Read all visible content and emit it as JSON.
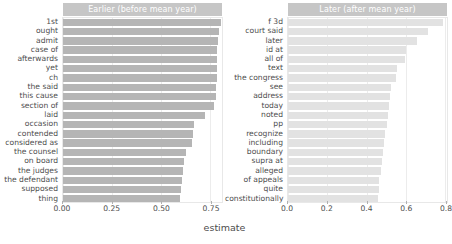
{
  "chart_data": {
    "type": "bar",
    "orientation": "horizontal",
    "title": "",
    "xlabel": "estimate",
    "ylabel": "",
    "grid": true,
    "legend": false,
    "facets": [
      {
        "name": "earlier",
        "strip_label": "Earlier (before mean year)",
        "bar_color": "#b5b5b5",
        "xlim": [
          0.0,
          0.81
        ],
        "xticks": [
          0.0,
          0.25,
          0.5,
          0.75
        ],
        "xticklabels": [
          "0.00",
          "0.25",
          "0.50",
          "0.75"
        ],
        "categories": [
          "1st",
          "ought",
          "admit",
          "case of",
          "afterwards",
          "yet",
          "ch",
          "the said",
          "this cause",
          "section of",
          "laid",
          "occasion",
          "contended",
          "considered as",
          "the counsel",
          "on board",
          "the judges",
          "the defendant",
          "supposed",
          "thing"
        ],
        "values": [
          0.805,
          0.795,
          0.788,
          0.787,
          0.784,
          0.783,
          0.782,
          0.781,
          0.78,
          0.77,
          0.722,
          0.668,
          0.661,
          0.656,
          0.627,
          0.617,
          0.611,
          0.607,
          0.601,
          0.598
        ]
      },
      {
        "name": "later",
        "strip_label": "Later (after mean year)",
        "bar_color": "#e2e2e2",
        "xlim": [
          0.0,
          0.81
        ],
        "xticks": [
          0.0,
          0.2,
          0.4,
          0.6,
          0.8
        ],
        "xticklabels": [
          "0.0",
          "0.2",
          "0.4",
          "0.6",
          "0.8"
        ],
        "categories": [
          "f 3d",
          "court said",
          "later",
          "id at",
          "all of",
          "text",
          "the congress",
          "see",
          "address",
          "today",
          "noted",
          "pp",
          "recognize",
          "including",
          "boundary",
          "supra at",
          "alleged",
          "of appeals",
          "quite",
          "constitutionally"
        ],
        "values": [
          0.79,
          0.715,
          0.655,
          0.6,
          0.595,
          0.557,
          0.55,
          0.525,
          0.52,
          0.512,
          0.508,
          0.505,
          0.492,
          0.488,
          0.483,
          0.477,
          0.472,
          0.465,
          0.462,
          0.458
        ]
      }
    ]
  }
}
